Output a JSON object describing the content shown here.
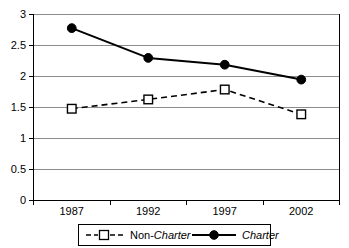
{
  "chart_data": {
    "type": "line",
    "title": "",
    "subtitle": "",
    "xlabel": "",
    "ylabel": "",
    "categories": [
      "1987",
      "1992",
      "1997",
      "2002"
    ],
    "ylim": [
      0,
      3
    ],
    "ytick_step": 0.5,
    "yticks": [
      "0",
      "0.5",
      "1",
      "1.5",
      "2",
      "2.5",
      "3"
    ],
    "grid": true,
    "grid_axis": "y",
    "legend_position": "bottom",
    "series": [
      {
        "name": "Non-Charter",
        "name_prefix": "Non-",
        "name_italic": "Charter",
        "values": [
          1.48,
          1.63,
          1.79,
          1.39
        ],
        "line_style": "dashed",
        "marker": "open-square",
        "color": "#000000"
      },
      {
        "name": "Charter",
        "name_prefix": "",
        "name_italic": "Charter",
        "values": [
          2.78,
          2.3,
          2.19,
          1.95
        ],
        "line_style": "solid",
        "marker": "filled-circle",
        "color": "#000000"
      }
    ]
  },
  "axes": {
    "y_tick_labels": [
      "3",
      "2.5",
      "2",
      "1.5",
      "1",
      "0.5",
      "0"
    ],
    "x_tick_labels": [
      "1987",
      "1992",
      "1997",
      "2002"
    ]
  },
  "legend": {
    "items": [
      {
        "prefix": "Non-",
        "italic": "Charter",
        "marker": "open-square",
        "line_style": "dashed"
      },
      {
        "prefix": "",
        "italic": "Charter",
        "marker": "filled-circle",
        "line_style": "solid"
      }
    ]
  },
  "colors": {
    "axis": "#000000",
    "grid": "#808080",
    "series": "#000000",
    "background": "#ffffff",
    "legend_border": "#000000"
  }
}
